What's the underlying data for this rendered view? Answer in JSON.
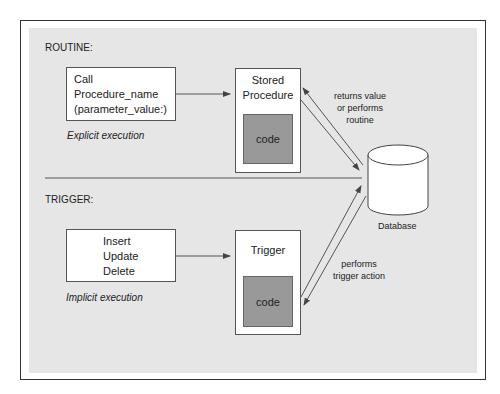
{
  "routine": {
    "heading": "ROUTINE:",
    "call_box": {
      "line1": "Call",
      "line2": "Procedure_name",
      "line3": "(parameter_value:)"
    },
    "execution_label": "Explicit execution",
    "stored_procedure": {
      "line1": "Stored",
      "line2": "Procedure",
      "code": "code"
    },
    "arrow_label": {
      "line1": "returns value",
      "line2": "or performs",
      "line3": "routine"
    }
  },
  "trigger": {
    "heading": "TRIGGER:",
    "events_box": {
      "line1": "Insert",
      "line2": "Update",
      "line3": "Delete"
    },
    "execution_label": "Implicit execution",
    "trigger_box": {
      "title": "Trigger",
      "code": "code"
    },
    "arrow_label": {
      "line1": "performs",
      "line2": "trigger action"
    }
  },
  "database": {
    "label": "Database"
  },
  "colors": {
    "panel": "#e6e6e6",
    "code_fill": "#999999",
    "border": "#333333"
  }
}
